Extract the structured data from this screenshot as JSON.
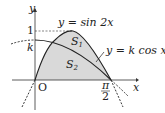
{
  "figure": {
    "axes": {
      "x_label": "x",
      "y_label": "y",
      "origin_label": "O"
    },
    "ticks": {
      "y_one": "1",
      "y_k": "k",
      "x_pi": "π",
      "x_two": "2"
    },
    "curves": [
      {
        "name": "sine",
        "label": "y = sin 2x"
      },
      {
        "name": "cosine",
        "label": "y = k cos x"
      }
    ],
    "regions": [
      {
        "name": "S1",
        "label_main": "S",
        "label_sub": "1"
      },
      {
        "name": "S2",
        "label_main": "S",
        "label_sub": "2"
      }
    ],
    "colors": {
      "shade": "#d9d9d9",
      "line": "#222222"
    }
  }
}
